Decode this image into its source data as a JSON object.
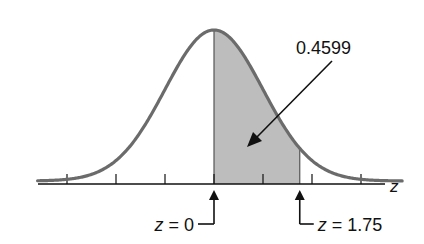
{
  "chart_data": {
    "type": "area",
    "title": "",
    "distribution": "standard normal",
    "xlabel": "z",
    "ylabel": "",
    "xlim": [
      -3.5,
      3.5
    ],
    "tick_values": [
      -3,
      -2,
      -1,
      0,
      1,
      2,
      3
    ],
    "tick_labels_shown": false,
    "shaded_region": {
      "from": 0,
      "to": 1.75
    },
    "area_annotation": "0.4599",
    "markers": [
      {
        "z": 0,
        "label": "z = 0",
        "side": "left"
      },
      {
        "z": 1.75,
        "label": "z = 1.75",
        "side": "right"
      }
    ],
    "grid": false,
    "colors": {
      "curve": "#6b6b6b",
      "shade": "#bdbdbd",
      "axis": "#111111"
    }
  }
}
